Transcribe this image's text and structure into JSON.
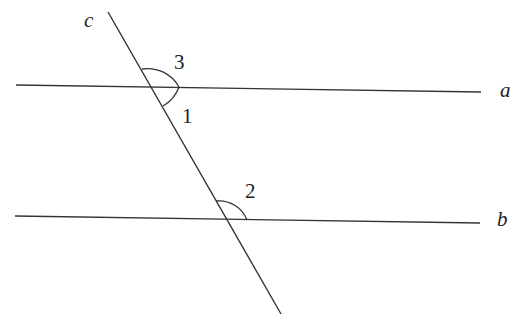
{
  "diagram": {
    "type": "parallel-lines-transversal",
    "lines": [
      {
        "id": "a",
        "label": "a",
        "x1": 16,
        "y1": 85,
        "x2": 481,
        "y2": 92
      },
      {
        "id": "b",
        "label": "b",
        "x1": 15,
        "y1": 216,
        "x2": 480,
        "y2": 223
      },
      {
        "id": "c",
        "label": "c",
        "x1": 108,
        "y1": 12,
        "x2": 281,
        "y2": 314
      }
    ],
    "angles": [
      {
        "id": "3",
        "label": "3",
        "description": "angle above line a, right of transversal c"
      },
      {
        "id": "1",
        "label": "1",
        "description": "angle below line a, right of transversal c"
      },
      {
        "id": "2",
        "label": "2",
        "description": "angle above line b, right of transversal c"
      }
    ],
    "stroke_color": "#333333"
  }
}
